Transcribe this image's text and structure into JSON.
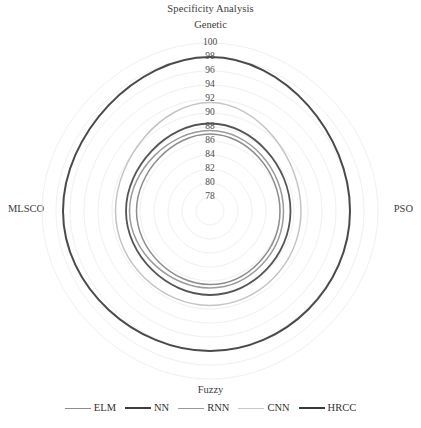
{
  "chart_data": {
    "type": "radar",
    "title": "Specificity Analysis",
    "categories": [
      "Genetic",
      "PSO",
      "Fuzzy",
      "MLSCO"
    ],
    "axis_labels": {
      "top": "Genetic",
      "right": "PSO",
      "bottom": "Fuzzy",
      "left": "MLSCO"
    },
    "radial_ticks": [
      100,
      98,
      96,
      94,
      92,
      90,
      88,
      86,
      84,
      82,
      80,
      78
    ],
    "tick_labels": [
      "100",
      "98",
      "96",
      "94",
      "92",
      "90",
      "88",
      "86",
      "84",
      "82",
      "80",
      "78"
    ],
    "rlim": [
      76,
      100
    ],
    "grid": true,
    "ylabel": "",
    "xlabel": "",
    "legend_position": "bottom",
    "series": [
      {
        "name": "ELM",
        "color": "#8d8d8d",
        "width": 1.5,
        "values": [
          87.0,
          86.0,
          86.5,
          86.5
        ]
      },
      {
        "name": "NN",
        "color": "#555555",
        "width": 1.8,
        "values": [
          88.5,
          87.5,
          88.0,
          88.0
        ]
      },
      {
        "name": "RNN",
        "color": "#9b9b9b",
        "width": 1.5,
        "values": [
          87.5,
          86.5,
          87.0,
          87.5
        ]
      },
      {
        "name": "CNN",
        "color": "#c4c4c4",
        "width": 1.5,
        "values": [
          91.5,
          89.0,
          89.5,
          89.5
        ]
      },
      {
        "name": "HRCC",
        "color": "#4a4a4a",
        "width": 2.0,
        "values": [
          98.0,
          96.0,
          96.0,
          97.0
        ]
      }
    ]
  },
  "legend": {
    "items": [
      {
        "label": "ELM",
        "color": "#8d8d8d",
        "width": 1.6
      },
      {
        "label": "NN",
        "color": "#3f3f3f",
        "width": 2.4
      },
      {
        "label": "RNN",
        "color": "#9b9b9b",
        "width": 1.6
      },
      {
        "label": "CNN",
        "color": "#c9c9c9",
        "width": 1.6
      },
      {
        "label": "HRCC",
        "color": "#3a3a3a",
        "width": 2.6
      }
    ]
  },
  "geometry": {
    "center_x": 210,
    "center_y": 211,
    "radius_at_max": 168,
    "grid_color": "#f0f0f0",
    "gridline_count": 12
  }
}
